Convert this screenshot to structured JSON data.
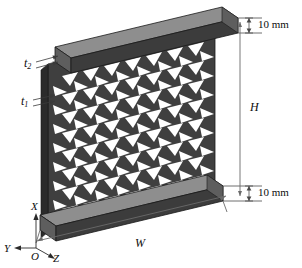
{
  "figure": {
    "type": "engineering-isometric-diagram",
    "background_color": "#ffffff",
    "ink_color": "#0d0d0d"
  },
  "colors": {
    "plate_front": "#3c3c3c",
    "plate_top": "#8e8e8e",
    "plate_end": "#5e5e5e",
    "lattice_dark": "#333333",
    "lattice_mid": "#4b4b4b",
    "lattice_light": "#616161",
    "void": "#ffffff",
    "dimension_line": "#4a4a4a",
    "outline": "#1a1a1a"
  },
  "dimensions": {
    "top_plate": {
      "label": "10 mm",
      "value": 10,
      "unit": "mm",
      "name": "top-face-sheet-thickness"
    },
    "bottom_plate": {
      "label": "10 mm",
      "value": 10,
      "unit": "mm",
      "name": "bottom-face-sheet-thickness"
    },
    "height": {
      "label": "H",
      "name": "overall-height"
    },
    "width": {
      "label": "W",
      "name": "overall-width"
    },
    "thickness_2": {
      "label": "t",
      "subscript": "2",
      "name": "lattice-wall-thickness-2"
    },
    "thickness_1": {
      "label": "t",
      "subscript": "1",
      "name": "lattice-wall-thickness-1"
    }
  },
  "axes": {
    "x": "X",
    "y": "Y",
    "z": "Z",
    "origin": "O"
  },
  "lattice": {
    "rows": 9,
    "columns": 8,
    "cell_shape": "triangular-void",
    "description": "Chevron / triangular lattice core between two face sheets"
  }
}
